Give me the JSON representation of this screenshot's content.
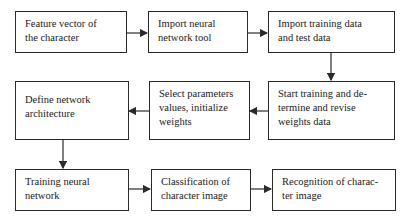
{
  "diagram": {
    "type": "flowchart",
    "nodes": [
      {
        "id": "n1",
        "label": "Feature vector of the character"
      },
      {
        "id": "n2",
        "label": "Import neural network tool"
      },
      {
        "id": "n3",
        "label": "Import training data and test data"
      },
      {
        "id": "n4",
        "label": "Start training and determine and revise weights data"
      },
      {
        "id": "n5",
        "label": "Select parameters values, initialize weights"
      },
      {
        "id": "n6",
        "label": "Define network architecture"
      },
      {
        "id": "n7",
        "label": "Training neural network"
      },
      {
        "id": "n8",
        "label": "Classification of character image"
      },
      {
        "id": "n9",
        "label": "Recognition of character image"
      }
    ],
    "display_lines": {
      "n1": [
        "Feature vector of",
        "the character"
      ],
      "n2": [
        "Import neural",
        "network tool"
      ],
      "n3": [
        "Import training data",
        "and test data"
      ],
      "n4": [
        "Start training and de-",
        "termine and revise",
        "weights data"
      ],
      "n5": [
        "Select parameters",
        "values, initialize",
        "weights"
      ],
      "n6": [
        "Define network",
        "architecture"
      ],
      "n7": [
        "Training neural",
        "network"
      ],
      "n8": [
        "Classification of",
        "character image"
      ],
      "n9": [
        "Recognition of charac-",
        "ter image"
      ]
    },
    "edges": [
      {
        "from": "n1",
        "to": "n2"
      },
      {
        "from": "n2",
        "to": "n3"
      },
      {
        "from": "n3",
        "to": "n4"
      },
      {
        "from": "n4",
        "to": "n5"
      },
      {
        "from": "n5",
        "to": "n6"
      },
      {
        "from": "n6",
        "to": "n7"
      },
      {
        "from": "n7",
        "to": "n8"
      },
      {
        "from": "n8",
        "to": "n9"
      }
    ],
    "colors": {
      "stroke": "#2a2a2a",
      "background": "#ffffff",
      "text": "#1a1a1a"
    }
  }
}
